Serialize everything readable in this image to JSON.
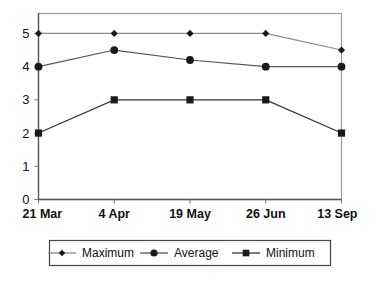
{
  "chart_data": {
    "type": "line",
    "title": "",
    "subtitle": "",
    "xlabel": "",
    "ylabel": "",
    "categories": [
      "21 Mar",
      "4 Apr",
      "19 May",
      "26 Jun",
      "13 Sep"
    ],
    "yticks": [
      0,
      1,
      2,
      3,
      4,
      5
    ],
    "ylim": [
      0,
      5.6
    ],
    "grid": false,
    "legend_position": "bottom",
    "series": [
      {
        "name": "Maximum",
        "marker": "diamond",
        "color": "#1a1a1a",
        "line_color": "#8a8a8a",
        "values": [
          5,
          5,
          5,
          5,
          4.5
        ]
      },
      {
        "name": "Average",
        "marker": "circle",
        "color": "#1a1a1a",
        "line_color": "#555555",
        "values": [
          4,
          4.5,
          4.2,
          4,
          4
        ]
      },
      {
        "name": "Minimum",
        "marker": "square",
        "color": "#1a1a1a",
        "line_color": "#333333",
        "values": [
          2,
          3,
          3,
          3,
          2
        ]
      }
    ]
  },
  "axes": {
    "y_tick_labels": [
      "0",
      "1",
      "2",
      "3",
      "4",
      "5"
    ],
    "x_tick_labels": [
      "21 Mar",
      "4 Apr",
      "19 May",
      "26 Jun",
      "13 Sep"
    ]
  },
  "legend": {
    "items": [
      {
        "label": "Maximum",
        "marker": "diamond-marker"
      },
      {
        "label": "Average",
        "marker": "circle-marker"
      },
      {
        "label": "Minimum",
        "marker": "square-marker"
      }
    ]
  },
  "colors": {
    "background": "#ffffff",
    "plot_border": "#9a9a9a",
    "axis": "#555555",
    "marker": "#1a1a1a",
    "legend_border": "#444444",
    "text": "#111111"
  }
}
